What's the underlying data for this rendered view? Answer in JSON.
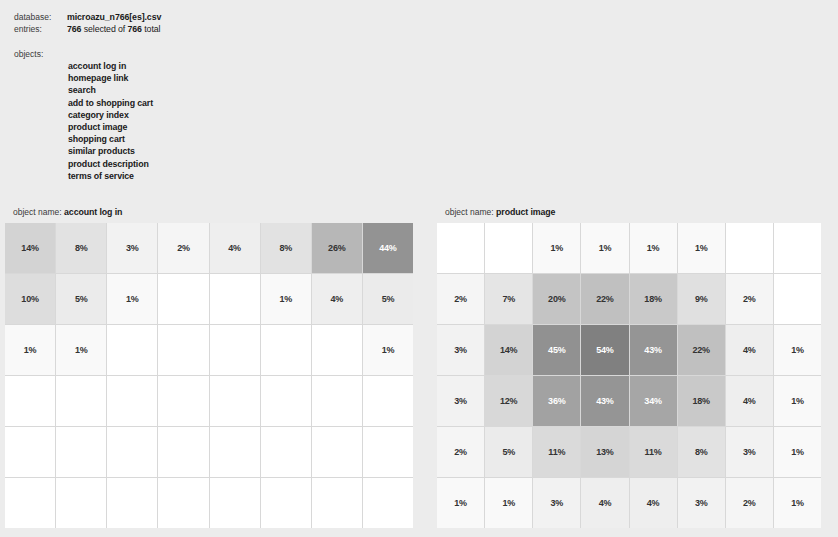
{
  "meta": {
    "database_label": "database:",
    "database_value": "microazu_n766[es].csv",
    "entries_label": "entries:",
    "entries_selected": "766",
    "entries_middle": " selected of ",
    "entries_total": "766",
    "entries_suffix": " total"
  },
  "objects": {
    "label": "objects:",
    "items": [
      "account log in",
      "homepage link",
      "search",
      "add to shopping cart",
      "category index",
      "product image",
      "shopping cart",
      "similar products",
      "product description",
      "terms of service"
    ]
  },
  "panels": {
    "left": {
      "title_prefix": "object name:",
      "title_value": "account log in"
    },
    "right": {
      "title_prefix": "object name:",
      "title_value": "product image"
    }
  },
  "colors": {
    "background": "#ececec",
    "grid_line": "#d8d8d8",
    "cell_empty": "#ffffff",
    "heat_max": "#8c8c8c",
    "text_dark": "#333333",
    "text_light": "#ffffff"
  },
  "chart_data": [
    {
      "type": "heatmap",
      "title": "account log in",
      "xlabel": "",
      "ylabel": "",
      "unit": "%",
      "rows": 6,
      "cols": 8,
      "vmin": 0,
      "vmax": 54,
      "values": [
        [
          14,
          8,
          3,
          2,
          4,
          8,
          26,
          44
        ],
        [
          10,
          5,
          1,
          null,
          null,
          1,
          4,
          5
        ],
        [
          1,
          1,
          null,
          null,
          null,
          null,
          null,
          1
        ],
        [
          null,
          null,
          null,
          null,
          null,
          null,
          null,
          null
        ],
        [
          null,
          null,
          null,
          null,
          null,
          null,
          null,
          null
        ],
        [
          null,
          null,
          null,
          null,
          null,
          null,
          null,
          null
        ]
      ],
      "labels": [
        [
          "14%",
          "8%",
          "3%",
          "2%",
          "4%",
          "8%",
          "26%",
          "44%"
        ],
        [
          "10%",
          "5%",
          "1%",
          "",
          "",
          "1%",
          "4%",
          "5%"
        ],
        [
          "1%",
          "1%",
          "",
          "",
          "",
          "",
          "",
          "1%"
        ],
        [
          "",
          "",
          "",
          "",
          "",
          "",
          "",
          ""
        ],
        [
          "",
          "",
          "",
          "",
          "",
          "",
          "",
          ""
        ],
        [
          "",
          "",
          "",
          "",
          "",
          "",
          "",
          ""
        ]
      ]
    },
    {
      "type": "heatmap",
      "title": "product image",
      "xlabel": "",
      "ylabel": "",
      "unit": "%",
      "rows": 6,
      "cols": 8,
      "vmin": 0,
      "vmax": 54,
      "values": [
        [
          null,
          null,
          1,
          1,
          1,
          1,
          null,
          null
        ],
        [
          2,
          7,
          20,
          22,
          18,
          9,
          2,
          null
        ],
        [
          3,
          14,
          45,
          54,
          43,
          22,
          4,
          1
        ],
        [
          3,
          12,
          36,
          43,
          34,
          18,
          4,
          1
        ],
        [
          2,
          5,
          11,
          13,
          11,
          8,
          3,
          1
        ],
        [
          1,
          1,
          3,
          4,
          4,
          3,
          2,
          1
        ]
      ],
      "labels": [
        [
          "",
          "",
          "1%",
          "1%",
          "1%",
          "1%",
          "",
          ""
        ],
        [
          "2%",
          "7%",
          "20%",
          "22%",
          "18%",
          "9%",
          "2%",
          ""
        ],
        [
          "3%",
          "14%",
          "45%",
          "54%",
          "43%",
          "22%",
          "4%",
          "1%"
        ],
        [
          "3%",
          "12%",
          "36%",
          "43%",
          "34%",
          "18%",
          "4%",
          "1%"
        ],
        [
          "2%",
          "5%",
          "11%",
          "13%",
          "11%",
          "8%",
          "3%",
          "1%"
        ],
        [
          "1%",
          "1%",
          "3%",
          "4%",
          "4%",
          "3%",
          "2%",
          "1%"
        ]
      ]
    }
  ]
}
